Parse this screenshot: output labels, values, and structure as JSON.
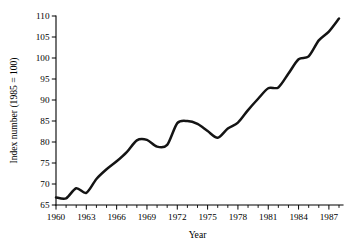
{
  "chart_data": {
    "type": "line",
    "title": "",
    "subtitle": "",
    "xlabel": "Year",
    "ylabel": "Index number (1985 = 100)",
    "xlim": [
      1960,
      1988
    ],
    "ylim": [
      65,
      110
    ],
    "grid": false,
    "legend": false,
    "legend_position": "none",
    "line_color": "#141414",
    "background_color": "#ffffff",
    "y_ticks": [
      65,
      70,
      75,
      80,
      85,
      90,
      95,
      100,
      105,
      110
    ],
    "y_tick_labels": [
      "65",
      "70",
      "75",
      "80",
      "85",
      "90",
      "95",
      "100",
      "105",
      "110"
    ],
    "x_ticks": [
      1960,
      1961,
      1962,
      1963,
      1964,
      1965,
      1966,
      1967,
      1968,
      1969,
      1970,
      1971,
      1972,
      1973,
      1974,
      1975,
      1976,
      1977,
      1978,
      1979,
      1980,
      1981,
      1982,
      1983,
      1984,
      1985,
      1986,
      1987,
      1988
    ],
    "x_tick_labels_major": [
      "1960",
      "1963",
      "1966",
      "1969",
      "1972",
      "1975",
      "1978",
      "1981",
      "1984",
      "1987"
    ],
    "x_major_years": [
      1960,
      1963,
      1966,
      1969,
      1972,
      1975,
      1978,
      1981,
      1984,
      1987
    ],
    "x": [
      1960,
      1961,
      1962,
      1963,
      1964,
      1965,
      1966,
      1967,
      1968,
      1969,
      1970,
      1971,
      1972,
      1973,
      1974,
      1975,
      1976,
      1977,
      1978,
      1979,
      1980,
      1981,
      1982,
      1983,
      1984,
      1985,
      1986,
      1987,
      1988
    ],
    "values": [
      66.8,
      66.6,
      69.0,
      67.9,
      71.2,
      73.5,
      75.4,
      77.6,
      80.4,
      80.5,
      78.9,
      79.3,
      84.5,
      85.0,
      84.3,
      82.6,
      81.0,
      83.2,
      84.6,
      87.6,
      90.3,
      92.8,
      93.0,
      96.3,
      99.7,
      100.4,
      104.2,
      106.3,
      109.4
    ],
    "series": [
      {
        "name": "Index number (1985 = 100)",
        "values": [
          66.8,
          66.6,
          69.0,
          67.9,
          71.2,
          73.5,
          75.4,
          77.6,
          80.4,
          80.5,
          78.9,
          79.3,
          84.5,
          85.0,
          84.3,
          82.6,
          81.0,
          83.2,
          84.6,
          87.6,
          90.3,
          92.8,
          93.0,
          96.3,
          99.7,
          100.4,
          104.2,
          106.3,
          109.4
        ]
      }
    ],
    "annotations": []
  }
}
